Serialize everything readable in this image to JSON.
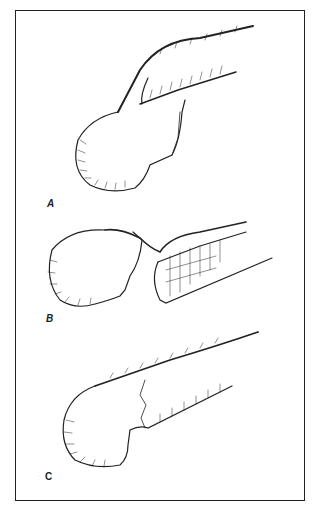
{
  "figure": {
    "panels": [
      {
        "label": "A",
        "description": "femoral head with fracture line and intact retinacular vessels"
      },
      {
        "label": "B",
        "description": "displaced femoral head fracture with torn shaft end"
      },
      {
        "label": "C",
        "description": "femoral head with minimally displaced fracture"
      }
    ]
  },
  "colors": {
    "ink": "#222222",
    "background": "#ffffff"
  }
}
